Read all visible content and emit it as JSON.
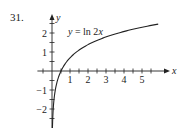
{
  "problem_number": "31.",
  "chart_data": {
    "type": "line",
    "title": "",
    "function_label": "y = ln 2x",
    "xlabel": "x",
    "ylabel": "y",
    "x_ticks": [
      1,
      2,
      3,
      4,
      5
    ],
    "y_ticks": [
      -2,
      -1,
      1,
      2
    ],
    "xlim": [
      -0.7,
      6
    ],
    "ylim": [
      -3,
      2.8
    ],
    "grid": false,
    "series": [
      {
        "name": "y = ln 2x",
        "x": [
          0.03,
          0.05,
          0.1,
          0.2,
          0.3,
          0.5,
          0.75,
          1,
          1.5,
          2,
          2.5,
          3,
          3.5,
          4,
          4.5,
          5,
          5.5,
          5.9
        ],
        "y": [
          -2.81,
          -2.3,
          -1.61,
          -0.92,
          -0.51,
          0.0,
          0.41,
          0.69,
          1.1,
          1.39,
          1.61,
          1.79,
          1.95,
          2.08,
          2.2,
          2.3,
          2.4,
          2.47
        ]
      }
    ]
  }
}
